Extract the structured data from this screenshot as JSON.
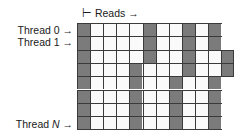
{
  "header": {
    "reads_label": "⊢ Reads →"
  },
  "threads": {
    "thread0": "Thread 0 →",
    "thread1": "Thread 1 →",
    "threadN_prefix": "Thread ",
    "threadN_var": "N",
    "threadN_suffix": " →"
  },
  "grid": {
    "columns": 11,
    "rows": 8,
    "shaded_color": "#7b7b7b",
    "empty_color": "#fafafa",
    "line_color": "#3a3a3a",
    "shaded": [
      [
        0,
        5,
        8,
        10
      ],
      [
        0,
        5,
        8,
        10
      ],
      [
        0,
        5,
        8,
        11
      ],
      [
        0,
        4,
        8,
        11
      ],
      [
        0,
        4,
        7,
        10
      ],
      [
        0,
        4,
        7,
        10
      ],
      [
        0,
        4,
        7,
        10
      ],
      [
        0,
        4,
        7,
        10
      ]
    ],
    "extended_rows": [
      2,
      3
    ]
  }
}
